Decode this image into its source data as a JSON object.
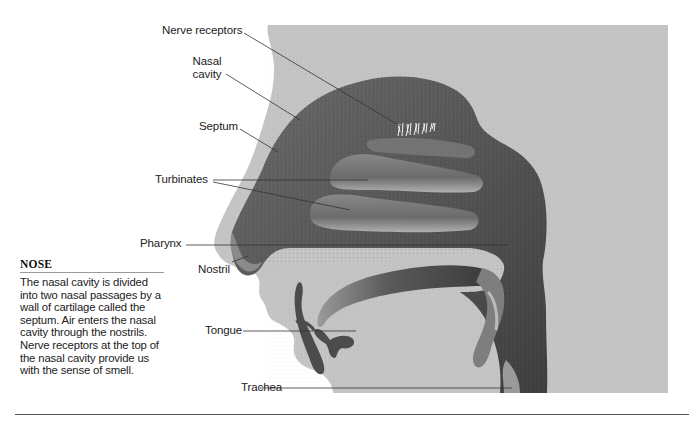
{
  "diagram": {
    "labels": {
      "nerve_receptors": "Nerve receptors",
      "nasal_cavity_line1": "Nasal",
      "nasal_cavity_line2": "cavity",
      "septum": "Septum",
      "turbinates": "Turbinates",
      "pharynx": "Pharynx",
      "nostril": "Nostril",
      "tongue": "Tongue",
      "trachea": "Trachea"
    },
    "colors": {
      "background_panel": "#c4c4c4",
      "tissue_dark": "#4a4a4a",
      "tissue_mid": "#777777",
      "tissue_light": "#a8a8a8",
      "leader_line": "#333333"
    }
  },
  "sidebar": {
    "title": "NOSE",
    "body": "The nasal cavity is divided into two nasal passages by a wall of cartilage called the septum. Air enters the nasal cavity through the nostrils. Nerve receptors at the top of the nasal cavity provide us with the sense of smell."
  }
}
